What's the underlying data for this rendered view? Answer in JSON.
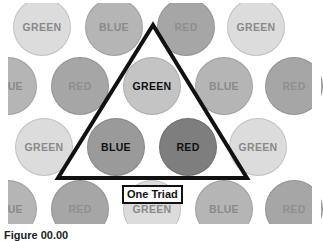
{
  "colors": {
    "GREEN": {
      "fill": "#dcdcdc",
      "text": "#8a8a8a"
    },
    "BLUE": {
      "fill": "#b5b5b5",
      "text": "#8a8a8a"
    },
    "RED": {
      "fill": "#a6a6a6",
      "text": "#8f8f8f"
    },
    "GREEN_active": {
      "fill": "#c4c4c4",
      "text": "#111111"
    },
    "BLUE_active": {
      "fill": "#9a9a9a",
      "text": "#111111"
    },
    "RED_active": {
      "fill": "#7e7e7e",
      "text": "#111111"
    },
    "triangle_stroke": "#111111"
  },
  "circle_radius": 29,
  "circles": [
    {
      "label": "GREEN",
      "x": 42,
      "y": 27,
      "active": false
    },
    {
      "label": "BLUE",
      "x": 114,
      "y": 27,
      "active": false
    },
    {
      "label": "RED",
      "x": 186,
      "y": 27,
      "active": false
    },
    {
      "label": "GREEN",
      "x": 256,
      "y": 27,
      "active": false
    },
    {
      "label": "BLUE",
      "x": 8,
      "y": 86,
      "active": false
    },
    {
      "label": "RED",
      "x": 80,
      "y": 86,
      "active": false
    },
    {
      "label": "GREEN",
      "x": 152,
      "y": 86,
      "active": true
    },
    {
      "label": "BLUE",
      "x": 224,
      "y": 86,
      "active": false
    },
    {
      "label": "RED",
      "x": 294,
      "y": 86,
      "active": false
    },
    {
      "label": "GREEN",
      "x": 44,
      "y": 147,
      "active": false
    },
    {
      "label": "BLUE",
      "x": 116,
      "y": 147,
      "active": true
    },
    {
      "label": "RED",
      "x": 188,
      "y": 147,
      "active": true
    },
    {
      "label": "GREEN",
      "x": 258,
      "y": 147,
      "active": false
    },
    {
      "label": "BLUE",
      "x": 8,
      "y": 209,
      "active": false
    },
    {
      "label": "RED",
      "x": 80,
      "y": 209,
      "active": false
    },
    {
      "label": "GREEN",
      "x": 152,
      "y": 209,
      "active": false
    },
    {
      "label": "BLUE",
      "x": 224,
      "y": 209,
      "active": false
    },
    {
      "label": "RED",
      "x": 294,
      "y": 209,
      "active": false
    }
  ],
  "triangle": {
    "points": [
      [
        153,
        25
      ],
      [
        58,
        178
      ],
      [
        247,
        178
      ]
    ],
    "stroke_width": 4
  },
  "triad_label": {
    "text": "One Triad",
    "x": 122,
    "y": 185
  },
  "caption": {
    "text": "Figure 00.00"
  }
}
